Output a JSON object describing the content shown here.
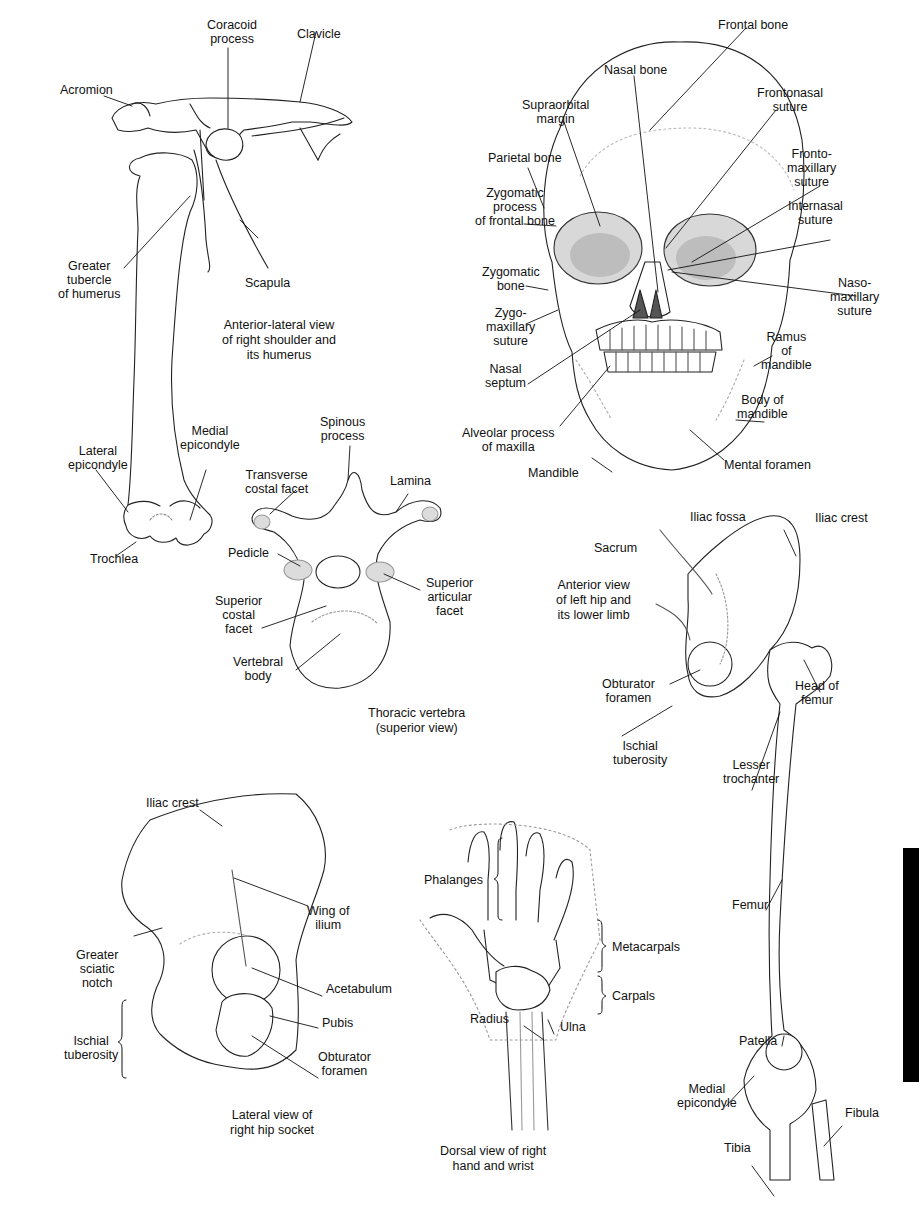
{
  "figure": {
    "type": "anatomical-diagram",
    "panels": [
      {
        "id": "shoulder",
        "caption": "Anterior-lateral view\nof right shoulder and\nits humerus",
        "labels": [
          "Coracoid\nprocess",
          "Clavicle",
          "Acromion",
          "Greater\ntubercle\nof humerus",
          "Scapula",
          "Lateral\nepicondyle",
          "Medial\nepicondyle",
          "Trochlea"
        ]
      },
      {
        "id": "skull",
        "labels": [
          "Frontal bone",
          "Nasal bone",
          "Frontonasal\nsuture",
          "Supraorbital\nmargin",
          "Parietal bone",
          "Fronto-\nmaxillary\nsuture",
          "Zygomatic\nprocess\nof frontal bone",
          "Internasal\nsuture",
          "Zygomatic\nbone",
          "Naso-\nmaxillary\nsuture",
          "Zygo-\nmaxillary\nsuture",
          "Ramus\nof\nmandible",
          "Nasal\nseptum",
          "Body of\nmandible",
          "Alveolar process\nof maxilla",
          "Mental foramen",
          "Mandible"
        ]
      },
      {
        "id": "vertebra",
        "caption": "Thoracic vertebra\n(superior view)",
        "labels": [
          "Spinous\nprocess",
          "Transverse\ncostal facet",
          "Lamina",
          "Pedicle",
          "Superior\narticular\nfacet",
          "Superior\ncostal\nfacet",
          "Vertebral\nbody"
        ]
      },
      {
        "id": "hip-lower-limb",
        "caption": "Anterior view\nof left hip and\nits lower limb",
        "labels": [
          "Iliac fossa",
          "Iliac crest",
          "Sacrum",
          "Head of\nfemur",
          "Obturator\nforamen",
          "Ischial\ntuberosity",
          "Lesser\ntrochanter",
          "Femur",
          "Patella",
          "Medial\nepicondyle",
          "Fibula",
          "Tibia"
        ]
      },
      {
        "id": "hip-socket",
        "caption": "Lateral view of\nright hip socket",
        "labels": [
          "Iliac crest",
          "Wing of\nilium",
          "Greater\nsciatic\nnotch",
          "Acetabulum",
          "Pubis",
          "Ischial\ntuberosity",
          "Obturator\nforamen"
        ]
      },
      {
        "id": "hand",
        "caption": "Dorsal view of right\nhand and wrist",
        "labels": [
          "Phalanges",
          "Metacarpals",
          "Carpals",
          "Radius",
          "Ulna"
        ]
      }
    ]
  },
  "colors": {
    "line": "#222222",
    "fill": "#ffffff",
    "shade": "#cfcfcf",
    "tab": "#000000"
  }
}
